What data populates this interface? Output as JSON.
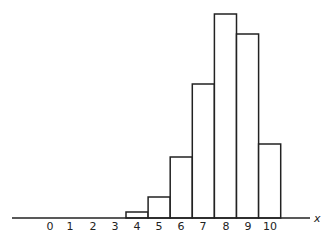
{
  "chart_data": {
    "type": "bar",
    "title": "",
    "xlabel": "x",
    "ylabel": "",
    "tick_labels": [
      "0",
      "1",
      "2",
      "3",
      "4",
      "5",
      "6",
      "7",
      "8",
      "9",
      "10"
    ],
    "categories": [
      "4",
      "5",
      "6",
      "7",
      "8",
      "9",
      "10"
    ],
    "values": [
      6,
      21,
      61,
      134,
      204,
      184,
      74
    ],
    "relative_values": [
      0.03,
      0.1,
      0.3,
      0.66,
      1.0,
      0.9,
      0.36
    ],
    "ylim": [
      0,
      210
    ],
    "grid": false,
    "legend": null,
    "bar_style": {
      "fill": "#ffffff",
      "stroke": "#222222"
    }
  }
}
